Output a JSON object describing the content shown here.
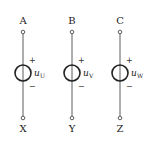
{
  "diagram": {
    "sources": [
      {
        "top": "A",
        "bottom": "X",
        "plus": "+",
        "minus": "−",
        "var": "u",
        "sub": "U",
        "x": 23
      },
      {
        "top": "B",
        "bottom": "Y",
        "plus": "+",
        "minus": "−",
        "var": "u",
        "sub": "V",
        "x": 72
      },
      {
        "top": "C",
        "bottom": "Z",
        "plus": "+",
        "minus": "−",
        "var": "u",
        "sub": "W",
        "x": 120
      }
    ],
    "colors": {
      "line": "#333333",
      "background": "#ffffff"
    }
  }
}
